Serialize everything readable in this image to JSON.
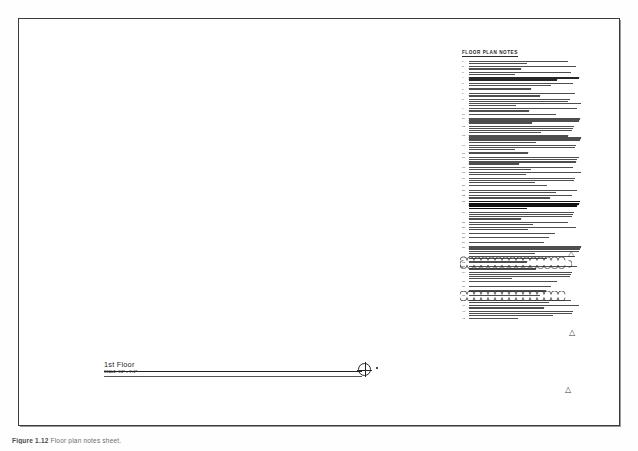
{
  "sheet": {
    "kind": "architectural-floor-plan-sheet",
    "background_color": "#ffffff",
    "border_color": "#3c3c3c",
    "ink_color": "#2f2f2f"
  },
  "notes": {
    "title": "FLOOR PLAN NOTES",
    "count": 48,
    "items": [
      {
        "number": "1.",
        "lines": 2
      },
      {
        "number": "2.",
        "lines": 2
      },
      {
        "number": "3.",
        "lines": 2
      },
      {
        "number": "4.",
        "lines": 2,
        "weight": "bold"
      },
      {
        "number": "5.",
        "lines": 2
      },
      {
        "number": "6.",
        "lines": 1
      },
      {
        "number": "7.",
        "lines": 2
      },
      {
        "number": "8.",
        "lines": 4
      },
      {
        "number": "9.",
        "lines": 2
      },
      {
        "number": "10.",
        "lines": 1
      },
      {
        "number": "11.",
        "lines": 3
      },
      {
        "number": "12.",
        "lines": 4
      },
      {
        "number": "13.",
        "lines": 4
      },
      {
        "number": "14.",
        "lines": 3
      },
      {
        "number": "15.",
        "lines": 1
      },
      {
        "number": "16.",
        "lines": 4
      },
      {
        "number": "17.",
        "lines": 2
      },
      {
        "number": "18.",
        "lines": 2
      },
      {
        "number": "19.",
        "lines": 3
      },
      {
        "number": "20.",
        "lines": 1
      },
      {
        "number": "21.",
        "lines": 2
      },
      {
        "number": "22.",
        "lines": 2
      },
      {
        "number": "23.",
        "lines": 4,
        "weight": "heavy"
      },
      {
        "number": "24.",
        "lines": 4
      },
      {
        "number": "25.",
        "lines": 2
      },
      {
        "number": "26.",
        "lines": 2
      },
      {
        "number": "27.",
        "lines": 1
      },
      {
        "number": "28.",
        "lines": 1
      },
      {
        "number": "29.",
        "lines": 1
      },
      {
        "number": "30.",
        "lines": 4
      },
      {
        "number": "31.",
        "lines": 2
      },
      {
        "number": "32.",
        "lines": 1
      },
      {
        "number": "33.",
        "lines": 2
      },
      {
        "number": "34.",
        "lines": 4,
        "cloud": "top"
      },
      {
        "number": "35.",
        "lines": 1
      },
      {
        "number": "36.",
        "lines": 1
      },
      {
        "number": "37.",
        "lines": 1
      },
      {
        "number": "38.",
        "lines": 1
      },
      {
        "number": "39.",
        "lines": 2
      },
      {
        "number": "40.",
        "lines": 2
      },
      {
        "number": "41.",
        "lines": 3,
        "cloud": "bottom"
      },
      {
        "number": "42.",
        "lines": 1
      }
    ]
  },
  "revision_markers": [
    {
      "name": "revision-delta-1",
      "label": "1",
      "x": 570,
      "y": 254
    },
    {
      "name": "revision-delta-2",
      "label": "1",
      "x": 571,
      "y": 333
    },
    {
      "name": "revision-delta-3",
      "label": "1",
      "x": 567,
      "y": 390
    }
  ],
  "title_block": {
    "title": "1st Floor",
    "scale": "SCALE: 1/4\" = 1'-0\""
  },
  "plan_marker": {
    "name": "section-circle-marker",
    "type": "crosshair-circle"
  },
  "caption": {
    "figure": "Figure 1.12",
    "text": "Floor plan notes sheet."
  }
}
